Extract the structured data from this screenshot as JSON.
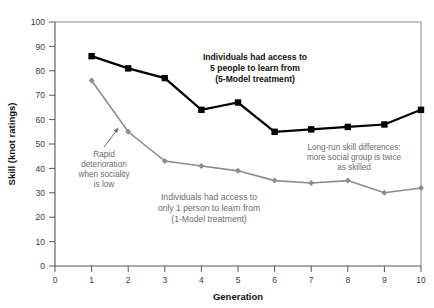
{
  "chart_data": {
    "type": "line",
    "title": "",
    "xlabel": "Generation",
    "ylabel": "Skill (knot ratings)",
    "x": [
      1,
      2,
      3,
      4,
      5,
      6,
      7,
      8,
      9,
      10
    ],
    "xlim": [
      0,
      10
    ],
    "ylim": [
      0,
      100
    ],
    "xticks": [
      "0",
      "1",
      "2",
      "3",
      "4",
      "5",
      "6",
      "7",
      "8",
      "9",
      "10"
    ],
    "yticks": [
      "0",
      "10",
      "20",
      "30",
      "40",
      "50",
      "60",
      "70",
      "80",
      "90",
      "100"
    ],
    "grid": false,
    "legend_position": "inline-annotations",
    "series": [
      {
        "name": "5-Model treatment",
        "color": "#000000",
        "marker": "square",
        "values": [
          86,
          81,
          77,
          64,
          67,
          55,
          56,
          57,
          58,
          64
        ]
      },
      {
        "name": "1-Model treatment",
        "color": "#8c8c8c",
        "marker": "diamond",
        "values": [
          76,
          55,
          43,
          41,
          39,
          35,
          34,
          35,
          30,
          32
        ]
      }
    ],
    "annotations": [
      {
        "id": "five-model-label",
        "lines": [
          "Individuals had access to",
          "5 people to learn from",
          "(5-Model treatment)"
        ],
        "style": "dark-bold"
      },
      {
        "id": "one-model-label",
        "lines": [
          "Individuals had access to",
          "only 1 person to learn from",
          "(1-Model treatment)"
        ],
        "style": "gray"
      },
      {
        "id": "rapid-deterioration-label",
        "lines": [
          "Rapid",
          "deterioration",
          "when sociality",
          "is low"
        ],
        "style": "gray"
      },
      {
        "id": "long-run-difference-label",
        "lines": [
          "Long-run skill differences:",
          "more social group is twice",
          "as skilled"
        ],
        "style": "gray"
      }
    ]
  },
  "colors": {
    "series_dark": "#000000",
    "series_gray": "#8c8c8c",
    "axis": "#5a5a5a",
    "text_dark": "#111111",
    "text_gray": "#6b6b6b",
    "background": "#ffffff"
  }
}
